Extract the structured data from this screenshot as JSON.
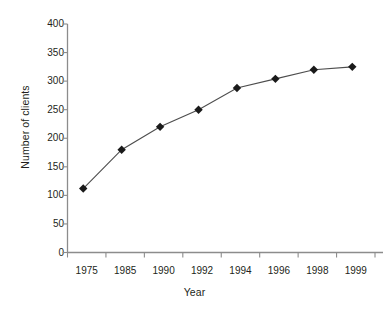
{
  "chart_data": {
    "type": "line",
    "title": "",
    "xlabel": "Year",
    "ylabel": "Number of clients",
    "categories": [
      "1975",
      "1985",
      "1990",
      "1992",
      "1994",
      "1996",
      "1998",
      "1999"
    ],
    "values": [
      112,
      180,
      220,
      250,
      288,
      304,
      320,
      325
    ],
    "series": [
      {
        "name": "Number of clients",
        "values": [
          112,
          180,
          220,
          250,
          288,
          304,
          320,
          325
        ]
      }
    ],
    "ylim": [
      0,
      400
    ],
    "yticks": [
      0,
      50,
      100,
      150,
      200,
      250,
      300,
      350,
      400
    ],
    "ytick_labels": [
      "0",
      "50",
      "100",
      "150",
      "200",
      "250",
      "300",
      "350",
      "400"
    ],
    "xtick_labels": [
      "1975",
      "1985",
      "1990",
      "1992",
      "1994",
      "1996",
      "1998",
      "1999"
    ],
    "grid": false,
    "legend": "none",
    "marker": "diamond",
    "line_color": "#4d4d4d",
    "marker_color": "#1a1a1a",
    "axis_color": "#808080"
  }
}
